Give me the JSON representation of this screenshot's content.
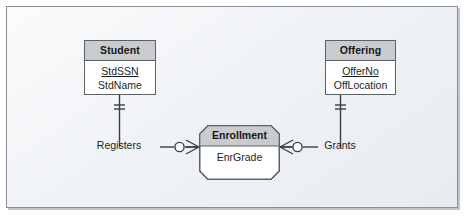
{
  "diagram": {
    "notation": "crow-foot",
    "background_color": "#eef1f5",
    "frame_border_color": "#8a8f96",
    "header_fill": "#c9cbcd",
    "line_color": "#3a3f45",
    "entities": [
      {
        "id": "student",
        "name": "Student",
        "shape": "rectangle",
        "attributes": [
          {
            "name": "StdSSN",
            "key": true
          },
          {
            "name": "StdName",
            "key": false
          }
        ]
      },
      {
        "id": "enrollment",
        "name": "Enrollment",
        "shape": "beveled-rectangle",
        "attributes": [
          {
            "name": "EnrGrade",
            "key": false
          }
        ]
      },
      {
        "id": "offering",
        "name": "Offering",
        "shape": "rectangle",
        "attributes": [
          {
            "name": "OfferNo",
            "key": true
          },
          {
            "name": "OffLocation",
            "key": false
          }
        ]
      }
    ],
    "relationships": [
      {
        "id": "registers",
        "label": "Registers",
        "from": "student",
        "to": "enrollment",
        "from_cardinality": "one-mandatory",
        "to_cardinality": "zero-or-many"
      },
      {
        "id": "grants",
        "label": "Grants",
        "from": "offering",
        "to": "enrollment",
        "from_cardinality": "one-mandatory",
        "to_cardinality": "zero-or-many"
      }
    ]
  }
}
